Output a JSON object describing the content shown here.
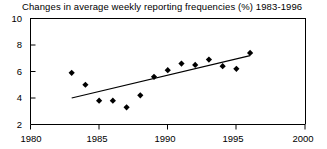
{
  "chart_data": {
    "type": "scatter",
    "title": "Changes in average weekly reporting frequencies (%) 1983-1996",
    "xlabel": "",
    "ylabel": "",
    "xlim": [
      1980,
      2000
    ],
    "ylim": [
      2,
      10
    ],
    "xticks": [
      1980,
      1985,
      1990,
      1995,
      2000
    ],
    "xtick_labels": [
      "1980",
      "1985",
      "1990",
      "1995",
      "2000"
    ],
    "yticks": [
      2,
      4,
      6,
      8,
      10
    ],
    "ytick_labels": [
      "2",
      "4",
      "6",
      "8",
      "10"
    ],
    "grid": false,
    "legend": null,
    "marker": "diamond",
    "marker_color": "#000000",
    "x": [
      1983,
      1984,
      1985,
      1986,
      1987,
      1988,
      1989,
      1990,
      1991,
      1992,
      1993,
      1994,
      1995,
      1996
    ],
    "values": [
      5.9,
      5.0,
      3.8,
      3.8,
      3.3,
      4.2,
      5.6,
      6.1,
      6.6,
      6.5,
      6.9,
      6.4,
      6.2,
      7.4
    ],
    "trendline": {
      "type": "line",
      "color": "#000000",
      "x": [
        1983,
        1996
      ],
      "y": [
        4.0,
        7.2
      ]
    }
  },
  "axes": {
    "ytick_labels": [
      "10",
      "8",
      "6",
      "4",
      "2"
    ],
    "xtick_labels": [
      "1980",
      "1985",
      "1990",
      "1995",
      "2000"
    ]
  }
}
